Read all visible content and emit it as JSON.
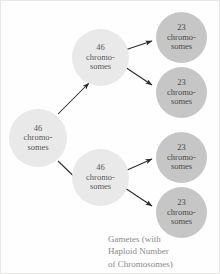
{
  "diagram": {
    "colors": {
      "background": "#fefefe",
      "diploid_cell": "#e9e9e9",
      "haploid_cell": "#c6c6c6",
      "arrow": "#2b2b2b",
      "caption_text": "#8a8a88",
      "node_text": "#5b5b5b"
    },
    "nodes": {
      "parent": {
        "number": "46",
        "label_line1": "chromo-",
        "label_line2": "somes",
        "ploidy": "diploid"
      },
      "daughter_top": {
        "number": "46",
        "label_line1": "chromo-",
        "label_line2": "somes",
        "ploidy": "diploid"
      },
      "daughter_bottom": {
        "number": "46",
        "label_line1": "chromo-",
        "label_line2": "somes",
        "ploidy": "diploid"
      },
      "gamete_1": {
        "number": "23",
        "label_line1": "chromo-",
        "label_line2": "somes",
        "ploidy": "haploid"
      },
      "gamete_2": {
        "number": "23",
        "label_line1": "chromo-",
        "label_line2": "somes",
        "ploidy": "haploid"
      },
      "gamete_3": {
        "number": "23",
        "label_line1": "chromo-",
        "label_line2": "somes",
        "ploidy": "haploid"
      },
      "gamete_4": {
        "number": "23",
        "label_line1": "chromo-",
        "label_line2": "somes",
        "ploidy": "haploid"
      }
    },
    "caption": {
      "line1": "Gametes (with",
      "line2": "Haploid Number",
      "line3": "of Chromosomes)"
    }
  }
}
